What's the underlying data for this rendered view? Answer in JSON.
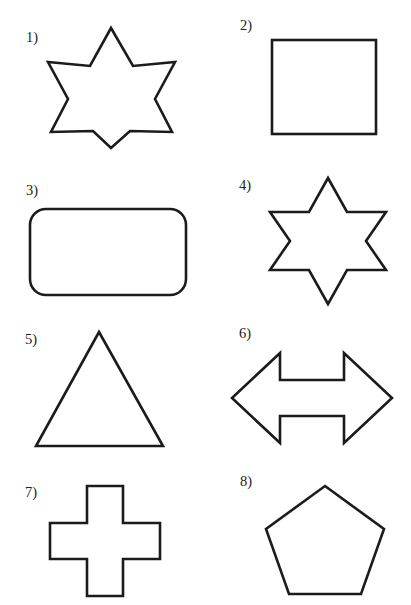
{
  "page": {
    "background_color": "#ffffff",
    "stroke_color": "#1b1b1b",
    "fill_color": "#ffffff",
    "clipped_header_text": "",
    "width": 411,
    "height": 605,
    "columns": 2,
    "rows": 4
  },
  "items": [
    {
      "number": "1)",
      "shape_name": "seven-pointed-star",
      "description": "Seven-pointed star (heptagram) outline",
      "label_x": 26,
      "label_y": 30,
      "box": {
        "x": 48,
        "y": 26,
        "w": 124,
        "h": 122
      }
    },
    {
      "number": "2)",
      "shape_name": "square",
      "description": "Square outline",
      "label_x": 240,
      "label_y": 18,
      "box": {
        "x": 272,
        "y": 40,
        "w": 104,
        "h": 94
      }
    },
    {
      "number": "3)",
      "shape_name": "rounded-rectangle",
      "description": "Rounded rectangle outline",
      "label_x": 26,
      "label_y": 183,
      "box": {
        "x": 30,
        "y": 209,
        "w": 156,
        "h": 86
      }
    },
    {
      "number": "4)",
      "shape_name": "six-pointed-star",
      "description": "Six-pointed star (hexagram) outline",
      "label_x": 239,
      "label_y": 178,
      "box": {
        "x": 268,
        "y": 177,
        "w": 118,
        "h": 126
      }
    },
    {
      "number": "5)",
      "shape_name": "triangle",
      "description": "Isosceles triangle outline",
      "label_x": 25,
      "label_y": 332,
      "box": {
        "x": 36,
        "y": 331,
        "w": 126,
        "h": 115
      }
    },
    {
      "number": "6)",
      "shape_name": "double-headed-arrow",
      "description": "Left-right double headed arrow outline",
      "label_x": 239,
      "label_y": 326,
      "box": {
        "x": 231,
        "y": 352,
        "w": 160,
        "h": 90
      }
    },
    {
      "number": "7)",
      "shape_name": "cross",
      "description": "Greek cross / plus shape outline",
      "label_x": 25,
      "label_y": 485,
      "box": {
        "x": 47,
        "y": 485,
        "w": 114,
        "h": 114
      }
    },
    {
      "number": "8)",
      "shape_name": "pentagon",
      "description": "Regular pentagon outline",
      "label_x": 240,
      "label_y": 474,
      "box": {
        "x": 264,
        "y": 485,
        "w": 120,
        "h": 110
      }
    }
  ]
}
